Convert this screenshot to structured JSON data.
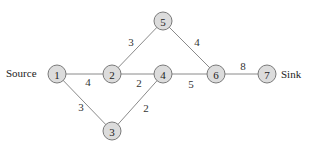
{
  "diagram": {
    "type": "network-graph",
    "labels": {
      "source": "Source",
      "sink": "Sink"
    },
    "nodes": [
      {
        "id": "1",
        "label": "1",
        "x": 57,
        "y": 74
      },
      {
        "id": "2",
        "label": "2",
        "x": 112,
        "y": 74
      },
      {
        "id": "3",
        "label": "3",
        "x": 112,
        "y": 131
      },
      {
        "id": "4",
        "label": "4",
        "x": 163,
        "y": 74
      },
      {
        "id": "5",
        "label": "5",
        "x": 163,
        "y": 21
      },
      {
        "id": "6",
        "label": "6",
        "x": 216,
        "y": 74
      },
      {
        "id": "7",
        "label": "7",
        "x": 267,
        "y": 74
      }
    ],
    "edges": [
      {
        "from": "1",
        "to": "2",
        "weight": "4",
        "lx": 88,
        "ly": 82
      },
      {
        "from": "1",
        "to": "3",
        "weight": "3",
        "lx": 81,
        "ly": 107
      },
      {
        "from": "2",
        "to": "5",
        "weight": "3",
        "lx": 131,
        "ly": 42
      },
      {
        "from": "2",
        "to": "4",
        "weight": "2",
        "lx": 139,
        "ly": 83
      },
      {
        "from": "3",
        "to": "4",
        "weight": "2",
        "lx": 146,
        "ly": 108
      },
      {
        "from": "5",
        "to": "6",
        "weight": "4",
        "lx": 197,
        "ly": 42
      },
      {
        "from": "4",
        "to": "6",
        "weight": "5",
        "lx": 191,
        "ly": 84
      },
      {
        "from": "6",
        "to": "7",
        "weight": "8",
        "lx": 243,
        "ly": 66
      }
    ],
    "colors": {
      "node_fill": "#dcdcdc",
      "node_stroke": "#7a7a7a",
      "edge": "#8a8a8a",
      "text": "#222222"
    }
  }
}
